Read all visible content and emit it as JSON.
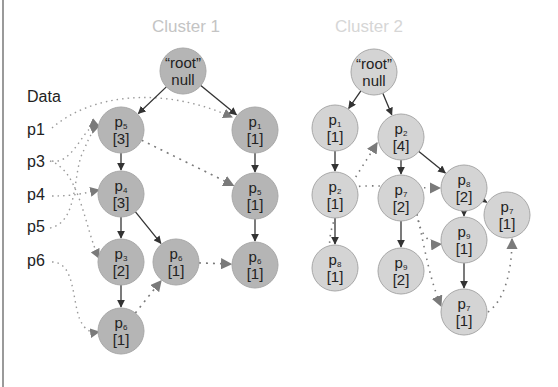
{
  "titles": {
    "cluster1": "Cluster 1",
    "cluster2": "Cluster 2"
  },
  "data_panel": {
    "heading": "Data",
    "items": [
      "p1",
      "p3",
      "p4",
      "p5",
      "p6"
    ]
  },
  "colors": {
    "cluster1_fill": "#b5b5b5",
    "cluster2_fill": "#d4d4d4",
    "node_stroke": "#a8a8a8",
    "edge": "#333333",
    "link": "#8a8a8a",
    "title": "#c4c4c4"
  },
  "cluster1": {
    "nodes": [
      {
        "id": "c1_root",
        "name": "“root”",
        "sub": "",
        "count": "null",
        "x": 183,
        "y": 71
      },
      {
        "id": "c1_p5a",
        "name": "p",
        "sub": "5",
        "count": "[3]",
        "x": 121,
        "y": 130
      },
      {
        "id": "c1_p1",
        "name": "p",
        "sub": "1",
        "count": "[1]",
        "x": 255,
        "y": 130
      },
      {
        "id": "c1_p4",
        "name": "p",
        "sub": "4",
        "count": "[3]",
        "x": 121,
        "y": 194
      },
      {
        "id": "c1_p5b",
        "name": "p",
        "sub": "5",
        "count": "[1]",
        "x": 255,
        "y": 196
      },
      {
        "id": "c1_p3",
        "name": "p",
        "sub": "3",
        "count": "[2]",
        "x": 121,
        "y": 262
      },
      {
        "id": "c1_p6a",
        "name": "p",
        "sub": "6",
        "count": "[1]",
        "x": 176,
        "y": 262
      },
      {
        "id": "c1_p6b",
        "name": "p",
        "sub": "6",
        "count": "[1]",
        "x": 255,
        "y": 265
      },
      {
        "id": "c1_p6c",
        "name": "p",
        "sub": "6",
        "count": "[1]",
        "x": 121,
        "y": 331
      }
    ],
    "edges": [
      [
        "c1_root",
        "c1_p5a"
      ],
      [
        "c1_root",
        "c1_p1"
      ],
      [
        "c1_p5a",
        "c1_p4"
      ],
      [
        "c1_p1",
        "c1_p5b"
      ],
      [
        "c1_p4",
        "c1_p3"
      ],
      [
        "c1_p4",
        "c1_p6a"
      ],
      [
        "c1_p5b",
        "c1_p6b"
      ],
      [
        "c1_p3",
        "c1_p6c"
      ]
    ],
    "links": [
      [
        "c1_p5a",
        "c1_p5b"
      ],
      [
        "c1_p6a",
        "c1_p6b"
      ],
      [
        "c1_p6c",
        "c1_p6a"
      ]
    ]
  },
  "cluster2": {
    "nodes": [
      {
        "id": "c2_root",
        "name": "“root”",
        "sub": "",
        "count": "null",
        "x": 374,
        "y": 72
      },
      {
        "id": "c2_p1",
        "name": "p",
        "sub": "1",
        "count": "[1]",
        "x": 335,
        "y": 128
      },
      {
        "id": "c2_p2a",
        "name": "p",
        "sub": "2",
        "count": "[4]",
        "x": 401,
        "y": 137
      },
      {
        "id": "c2_p8a",
        "name": "p",
        "sub": "8",
        "count": "[2]",
        "x": 464,
        "y": 188
      },
      {
        "id": "c2_p2b",
        "name": "p",
        "sub": "2",
        "count": "[1]",
        "x": 335,
        "y": 195
      },
      {
        "id": "c2_p7a",
        "name": "p",
        "sub": "7",
        "count": "[2]",
        "x": 401,
        "y": 198
      },
      {
        "id": "c2_p9a",
        "name": "p",
        "sub": "9",
        "count": "[1]",
        "x": 464,
        "y": 240
      },
      {
        "id": "c2_p7b",
        "name": "p",
        "sub": "7",
        "count": "[1]",
        "x": 507,
        "y": 215
      },
      {
        "id": "c2_p8b",
        "name": "p",
        "sub": "8",
        "count": "[1]",
        "x": 335,
        "y": 268
      },
      {
        "id": "c2_p9b",
        "name": "p",
        "sub": "9",
        "count": "[2]",
        "x": 401,
        "y": 271
      },
      {
        "id": "c2_p7c",
        "name": "p",
        "sub": "7",
        "count": "[1]",
        "x": 464,
        "y": 312
      }
    ],
    "edges": [
      [
        "c2_root",
        "c2_p1"
      ],
      [
        "c2_root",
        "c2_p2a"
      ],
      [
        "c2_p1",
        "c2_p2b"
      ],
      [
        "c2_p2a",
        "c2_p7a"
      ],
      [
        "c2_p2a",
        "c2_p8a"
      ],
      [
        "c2_p2b",
        "c2_p8b"
      ],
      [
        "c2_p7a",
        "c2_p9b"
      ],
      [
        "c2_p8a",
        "c2_p9a"
      ],
      [
        "c2_p8a",
        "c2_p7b"
      ],
      [
        "c2_p9a",
        "c2_p7c"
      ]
    ]
  }
}
